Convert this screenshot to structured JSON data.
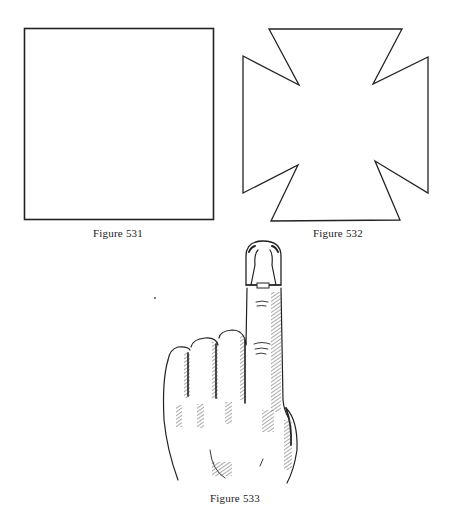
{
  "figures": [
    {
      "id": "531",
      "caption": "Figure 531",
      "subject": "square-outline"
    },
    {
      "id": "532",
      "caption": "Figure 532",
      "subject": "maltese-cross-outline"
    },
    {
      "id": "533",
      "caption": "Figure 533",
      "subject": "hand-with-raised-index-finger-wearing-fingertip-cap"
    }
  ],
  "colors": {
    "ink": "#222222",
    "paper": "#ffffff",
    "hatch": "#555555"
  }
}
